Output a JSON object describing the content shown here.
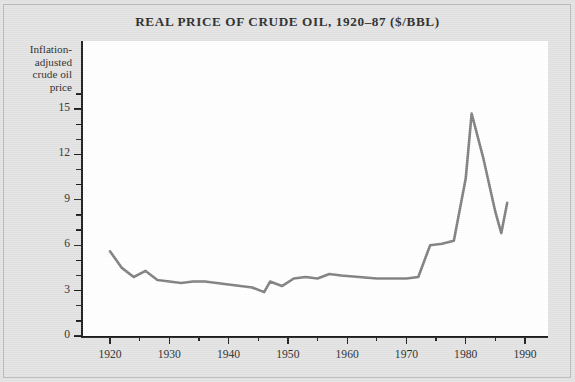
{
  "chart": {
    "title": "REAL PRICE OF CRUDE OIL, 1920–87 ($/BBL)",
    "y_axis_label": "Inflation-\nadjusted\ncrude oil\nprice",
    "line_color": "#7f7f7f",
    "axis_color": "#1c1c1c",
    "background_color": "#e2e2e2",
    "plot_background_color": "#ffffff"
  },
  "chart_data": {
    "type": "line",
    "title": "REAL PRICE OF CRUDE OIL, 1920–87 ($/BBL)",
    "xlabel": "",
    "ylabel": "Inflation-adjusted crude oil price",
    "xlim": [
      1918,
      1990
    ],
    "ylim": [
      0,
      16.2
    ],
    "xticks": [
      1920,
      1930,
      1940,
      1950,
      1960,
      1970,
      1980,
      1990
    ],
    "xtick_labels": [
      "1920",
      "1930",
      "1940",
      "1950",
      "1960",
      "1970",
      "1980",
      "1990"
    ],
    "x_minor_ticks": [
      1925,
      1935,
      1945,
      1955,
      1965,
      1975,
      1985
    ],
    "yticks": [
      0,
      3,
      6,
      9,
      12,
      15
    ],
    "ytick_labels": [
      "0",
      "3",
      "6",
      "9",
      "12",
      "15"
    ],
    "y_minor_ticks": [
      1,
      2,
      4,
      5,
      7,
      8,
      10,
      11,
      13,
      14,
      16
    ],
    "grid": false,
    "legend": null,
    "series": [
      {
        "name": "Inflation-adjusted crude oil price",
        "color": "#7f7f7f",
        "x": [
          1920,
          1922,
          1924,
          1926,
          1928,
          1930,
          1932,
          1934,
          1936,
          1938,
          1940,
          1942,
          1944,
          1946,
          1947,
          1949,
          1951,
          1953,
          1955,
          1957,
          1959,
          1962,
          1965,
          1968,
          1970,
          1972,
          1974,
          1976,
          1978,
          1980,
          1981,
          1983,
          1985,
          1986,
          1987
        ],
        "y": [
          5.6,
          4.5,
          3.9,
          4.3,
          3.7,
          3.6,
          3.5,
          3.6,
          3.6,
          3.5,
          3.4,
          3.3,
          3.2,
          2.9,
          3.6,
          3.3,
          3.8,
          3.9,
          3.8,
          4.1,
          4.0,
          3.9,
          3.8,
          3.8,
          3.8,
          3.9,
          6.0,
          6.1,
          6.3,
          10.4,
          14.7,
          11.7,
          8.2,
          6.8,
          8.8
        ]
      }
    ]
  },
  "axes": {
    "y_label_lines": [
      "Inflation-",
      "adjusted",
      "crude oil",
      "price"
    ]
  }
}
